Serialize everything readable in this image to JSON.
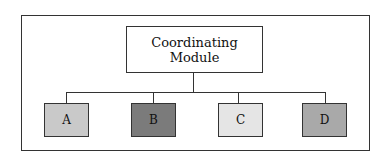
{
  "diagram": {
    "root": {
      "line1": "Coordinating",
      "line2": "Module",
      "fill": "#ffffff"
    },
    "children": [
      {
        "label": "A",
        "fill": "#c9c9c9"
      },
      {
        "label": "B",
        "fill": "#7b7b7b"
      },
      {
        "label": "C",
        "fill": "#e5e5e5"
      },
      {
        "label": "D",
        "fill": "#a9a9a9"
      }
    ],
    "edges": [
      {
        "from": "Coordinating Module",
        "to": "A"
      },
      {
        "from": "Coordinating Module",
        "to": "B"
      },
      {
        "from": "Coordinating Module",
        "to": "C"
      },
      {
        "from": "Coordinating Module",
        "to": "D"
      }
    ]
  }
}
